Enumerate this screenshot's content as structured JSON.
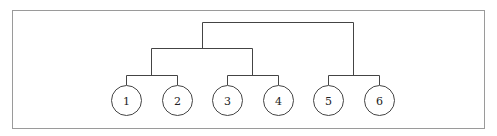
{
  "diagram": {
    "type": "binary-tree",
    "leaves": [
      {
        "label": "1",
        "cx": 126
      },
      {
        "label": "2",
        "cx": 177
      },
      {
        "label": "3",
        "cx": 227
      },
      {
        "label": "4",
        "cx": 278
      },
      {
        "label": "5",
        "cx": 328
      },
      {
        "label": "6",
        "cx": 379
      }
    ],
    "structure": "((1,2),(3,4)),(5,6)"
  }
}
